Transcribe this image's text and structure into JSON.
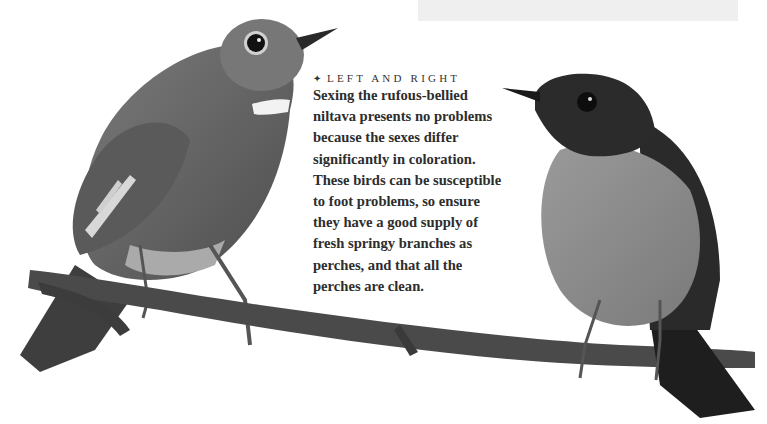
{
  "page": {
    "background": "#ffffff",
    "top_band_color": "#efefef"
  },
  "photo": {
    "subject": "Rufous-bellied niltava pair on a branch",
    "left_bird": "female-niltava",
    "right_bird": "male-niltava",
    "colors": {
      "left_bird_body": "#6e6e6e",
      "right_bird_head": "#2b2b2b",
      "right_bird_breast": "#8a8a8a",
      "branch": "#4a4a4a"
    }
  },
  "caption": {
    "bullet_icon": "diamond-bullet",
    "bullet_glyph": "✦",
    "heading": "LEFT AND RIGHT",
    "lines": [
      "Sexing the rufous-bellied",
      "niltava presents no problems",
      "because the sexes differ",
      "significantly in coloration.",
      "These birds can be susceptible",
      "to foot problems, so ensure",
      "they have a good supply of",
      "fresh springy branches as",
      "perches, and that all the",
      "perches are clean."
    ]
  }
}
